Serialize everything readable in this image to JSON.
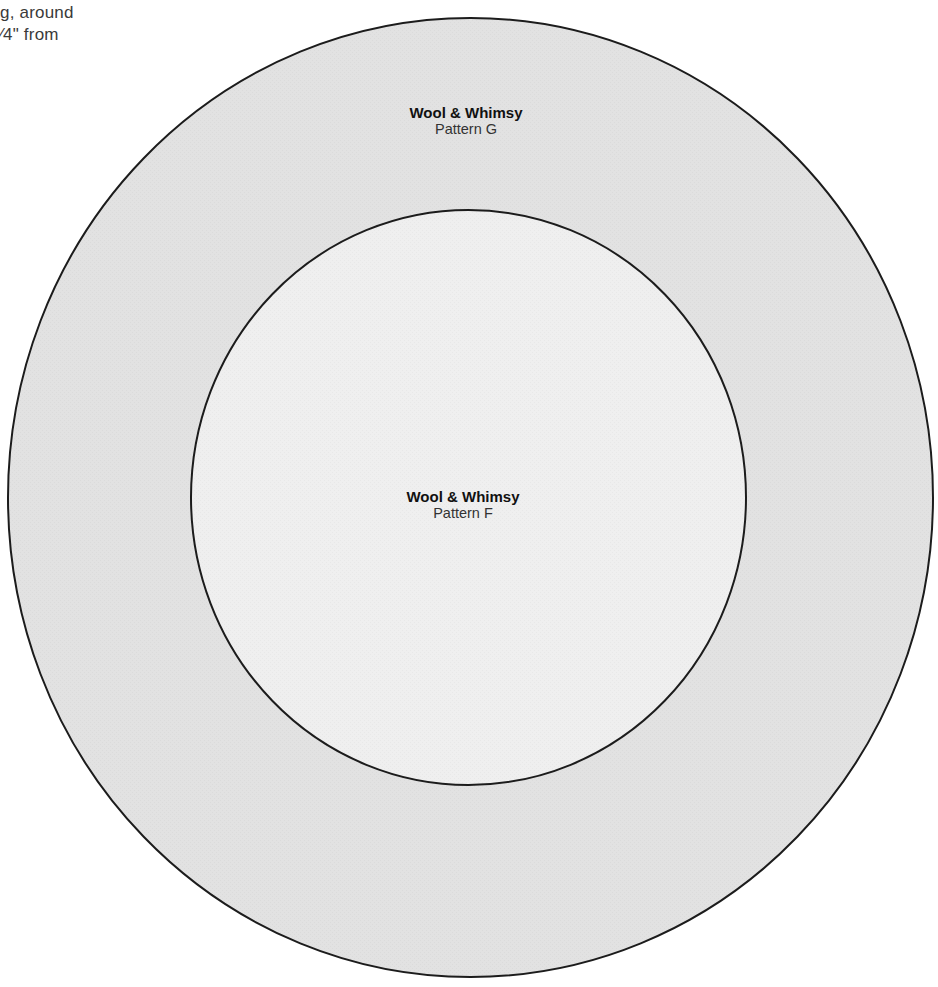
{
  "instructions": {
    "line1": "g, around",
    "line2": "⁄4\" from"
  },
  "outer_circle": {
    "brand": "Wool & Whimsy",
    "pattern": "Pattern G",
    "fill": "#e2e2e2",
    "stroke": "#1c1c1c"
  },
  "inner_circle": {
    "brand": "Wool & Whimsy",
    "pattern": "Pattern F",
    "fill": "#efefef",
    "stroke": "#1c1c1c"
  },
  "background": "#ffffff"
}
